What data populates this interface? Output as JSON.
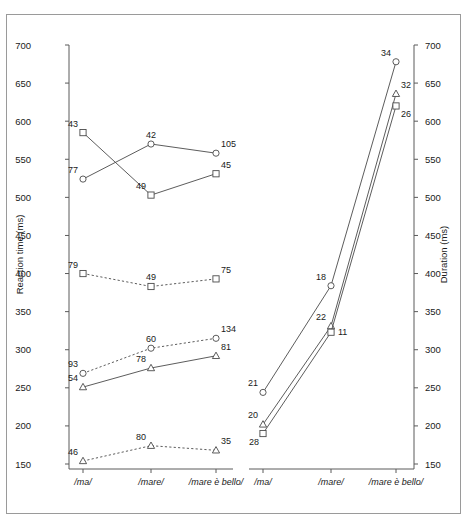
{
  "figure": {
    "width": 468,
    "height": 526,
    "background": "#ffffff",
    "frame_color": "#9a9a9a",
    "line_color": "#4a4a4a",
    "axis_color": "#5a5a5a"
  },
  "chart_data": [
    {
      "type": "line",
      "panel": "left",
      "title": "",
      "xlabel": "",
      "ylabel": "Reaction time (ms)",
      "categories": [
        "/ma/",
        "/mare/",
        "/mare è bello/"
      ],
      "ylim": [
        150,
        700
      ],
      "yticks": [
        150,
        200,
        250,
        300,
        350,
        400,
        450,
        500,
        550,
        600,
        650,
        700
      ],
      "grid": false,
      "legend": "none",
      "series": [
        {
          "name": "square-solid",
          "marker": "square",
          "linestyle": "solid",
          "values": [
            585,
            503,
            531
          ],
          "point_labels": [
            "43",
            "49",
            "45"
          ],
          "label_pos": [
            "above-left",
            "above-left",
            "above-right"
          ]
        },
        {
          "name": "circle-solid",
          "marker": "circle",
          "linestyle": "solid",
          "values": [
            524,
            570,
            558
          ],
          "point_labels": [
            "77",
            "42",
            "105"
          ],
          "label_pos": [
            "above-left",
            "above",
            "above-right"
          ]
        },
        {
          "name": "square-dashed",
          "marker": "square",
          "linestyle": "dashed",
          "values": [
            400,
            383,
            393
          ],
          "point_labels": [
            "79",
            "49",
            "75"
          ],
          "label_pos": [
            "above-left",
            "above",
            "above-right"
          ]
        },
        {
          "name": "circle-dashed",
          "marker": "circle",
          "linestyle": "dashed",
          "values": [
            269,
            302,
            315
          ],
          "point_labels": [
            "93",
            "60",
            "134"
          ],
          "label_pos": [
            "above-left",
            "above",
            "above-right"
          ]
        },
        {
          "name": "triangle-solid",
          "marker": "triangle",
          "linestyle": "solid",
          "values": [
            251,
            276,
            292
          ],
          "point_labels": [
            "54",
            "78",
            "81"
          ],
          "label_pos": [
            "above-left",
            "above-left",
            "above-right"
          ]
        },
        {
          "name": "triangle-dashed",
          "marker": "triangle",
          "linestyle": "dashed",
          "values": [
            154,
            174,
            168
          ],
          "point_labels": [
            "46",
            "80",
            "35"
          ],
          "label_pos": [
            "above-left",
            "above-left",
            "above-right"
          ]
        }
      ]
    },
    {
      "type": "line",
      "panel": "right",
      "title": "",
      "xlabel": "",
      "ylabel": "Duration (ms)",
      "categories": [
        "/ma/",
        "/mare/",
        "/mare è bello/"
      ],
      "ylim": [
        150,
        700
      ],
      "yticks": [
        150,
        200,
        250,
        300,
        350,
        400,
        450,
        500,
        550,
        600,
        650,
        700
      ],
      "grid": false,
      "legend": "none",
      "series": [
        {
          "name": "circle-solid",
          "marker": "circle",
          "linestyle": "solid",
          "values": [
            244,
            384,
            678
          ],
          "point_labels": [
            "21",
            "18",
            "34"
          ],
          "label_pos": [
            "above-left",
            "above-left",
            "above-left"
          ]
        },
        {
          "name": "triangle-solid",
          "marker": "triangle",
          "linestyle": "solid",
          "values": [
            202,
            331,
            636
          ],
          "point_labels": [
            "20",
            "22",
            "32"
          ],
          "label_pos": [
            "above-left",
            "above-left",
            "above-right"
          ]
        },
        {
          "name": "square-solid",
          "marker": "square",
          "linestyle": "solid",
          "values": [
            190,
            323,
            620
          ],
          "point_labels": [
            "28",
            "11",
            "26"
          ],
          "label_pos": [
            "below-left",
            "right",
            "below-right"
          ]
        }
      ]
    }
  ]
}
